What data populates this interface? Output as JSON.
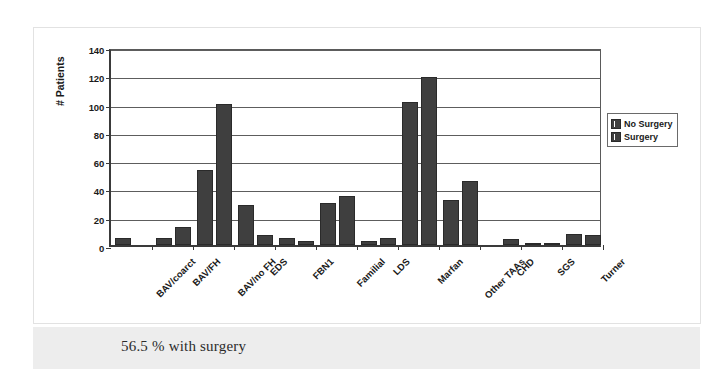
{
  "caption": {
    "text": "56.5 % with surgery"
  },
  "legend": {
    "position": "right",
    "entries": [
      {
        "label": "No Surgery",
        "color": "#3f3f3f"
      },
      {
        "label": "Surgery",
        "color": "#3f3f3f"
      }
    ]
  },
  "chart_data": {
    "type": "bar",
    "title": "",
    "xlabel": "",
    "ylabel": "# Patients",
    "ylim": [
      0,
      140
    ],
    "yticks": [
      0,
      20,
      40,
      60,
      80,
      100,
      120,
      140
    ],
    "grid": true,
    "legend_position": "right",
    "categories": [
      "BAV/coarct",
      "BAV/FH",
      "BAV/no FH",
      "EDS",
      "FBN1",
      "Familial",
      "LDS",
      "Marfan",
      "Other TAAs",
      "CHD",
      "SGS",
      "Turner"
    ],
    "series": [
      {
        "name": "No Surgery",
        "color": "#3f3f3f",
        "values": [
          5,
          5,
          53,
          28,
          5,
          30,
          3,
          101,
          32,
          0,
          1,
          8
        ]
      },
      {
        "name": "Surgery",
        "color": "#3f3f3f",
        "values": [
          0,
          13,
          100,
          7,
          3,
          35,
          5,
          119,
          45,
          4,
          1,
          7
        ]
      }
    ]
  }
}
